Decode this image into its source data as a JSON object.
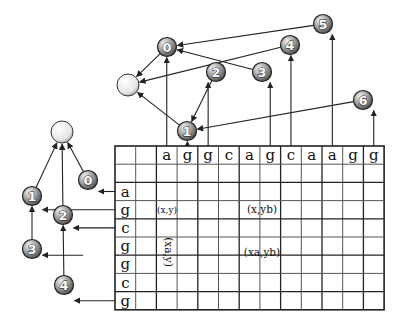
{
  "grid": {
    "x": 115,
    "y": 146,
    "cols": 13,
    "rows": 9,
    "col_width": 20.7,
    "row_height": 18.2,
    "column_header": [
      "",
      "",
      "a",
      "g",
      "g",
      "c",
      "a",
      "g",
      "c",
      "a",
      "a",
      "g",
      "g"
    ],
    "row_header": [
      "",
      "",
      "a",
      "g",
      "c",
      "g",
      "g",
      "c",
      "g"
    ],
    "cell_labels": [
      {
        "text": "(x,y)",
        "x": 167,
        "y": 213,
        "rotate": 0
      },
      {
        "text": "(x,yb)",
        "x": 262,
        "y": 213,
        "rotate": 0
      },
      {
        "text": "(xa,y)",
        "x": 168,
        "y": 255,
        "rotate": 90
      },
      {
        "text": "(xa,yb)",
        "x": 262,
        "y": 256,
        "rotate": 0
      }
    ]
  },
  "top_tree": {
    "root": {
      "x": 128,
      "y": 85
    },
    "nodes": [
      {
        "id": "0",
        "x": 167,
        "y": 47
      },
      {
        "id": "1",
        "x": 187,
        "y": 131
      },
      {
        "id": "2",
        "x": 216,
        "y": 72
      },
      {
        "id": "3",
        "x": 262,
        "y": 72
      },
      {
        "id": "4",
        "x": 290,
        "y": 45
      },
      {
        "id": "5",
        "x": 323,
        "y": 24
      },
      {
        "id": "6",
        "x": 363,
        "y": 100
      }
    ],
    "edges": [
      {
        "from": "0",
        "to": "root"
      },
      {
        "from": "1",
        "to": "root"
      },
      {
        "from": "4",
        "to": "root"
      },
      {
        "from": "2",
        "to": "1"
      },
      {
        "from": "6",
        "to": "1"
      },
      {
        "from": "3",
        "to": "0"
      },
      {
        "from": "5",
        "to": "0"
      }
    ],
    "column_links": [
      {
        "to": "0",
        "col": 2
      },
      {
        "to": "1",
        "col": 3
      },
      {
        "to": "2",
        "col": 4
      },
      {
        "to": "3",
        "col": 7
      },
      {
        "to": "4",
        "col": 8
      },
      {
        "to": "5",
        "col": 10
      },
      {
        "to": "6",
        "col": 12
      }
    ]
  },
  "left_tree": {
    "root": {
      "x": 62,
      "y": 132
    },
    "nodes": [
      {
        "id": "0",
        "x": 88,
        "y": 180
      },
      {
        "id": "1",
        "x": 32,
        "y": 196
      },
      {
        "id": "2",
        "x": 63,
        "y": 215
      },
      {
        "id": "3",
        "x": 32,
        "y": 249
      },
      {
        "id": "4",
        "x": 64,
        "y": 285
      }
    ],
    "edges": [
      {
        "from": "0",
        "to": "root"
      },
      {
        "from": "1",
        "to": "root"
      },
      {
        "from": "2",
        "to": "root"
      },
      {
        "from": "3",
        "to": "1"
      },
      {
        "from": "4",
        "to": "2"
      }
    ],
    "row_links": [
      {
        "to": "0",
        "row": 2
      },
      {
        "to": "1",
        "row": 3
      },
      {
        "to": "2",
        "row": 4
      },
      {
        "to": "3",
        "row": 5.5
      },
      {
        "to": "4",
        "row": 8
      }
    ]
  },
  "colors": {
    "line": "#222222",
    "grid_line": "#333333",
    "node_fill_light": "#e8e8e8",
    "node_fill_dark": "#6e6e6e",
    "root_fill": "#f4f4f4"
  }
}
